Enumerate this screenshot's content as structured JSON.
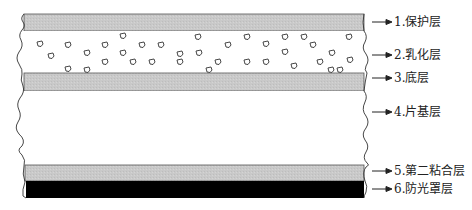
{
  "diagram": {
    "title": "",
    "colors": {
      "protective": "#c8c8c8",
      "emulsion": "#ffffff",
      "subbing": "#c8c8c8",
      "base": "#ffffff",
      "second_adhesive": "#c8c8c8",
      "antihalation": "#000000",
      "outline": "#444444"
    },
    "layers": [
      {
        "id": 1,
        "label": "1.保护层",
        "top": 14,
        "bottom": 31
      },
      {
        "id": 2,
        "label": "2.乳化层",
        "top": 31,
        "bottom": 73
      },
      {
        "id": 3,
        "label": "3.底层",
        "top": 73,
        "bottom": 91
      },
      {
        "id": 4,
        "label": "4.片基层",
        "top": 91,
        "bottom": 165
      },
      {
        "id": 5,
        "label": "5.第二粘合层",
        "top": 165,
        "bottom": 181
      },
      {
        "id": 6,
        "label": "6.防光罩层",
        "top": 181,
        "bottom": 198
      }
    ]
  }
}
